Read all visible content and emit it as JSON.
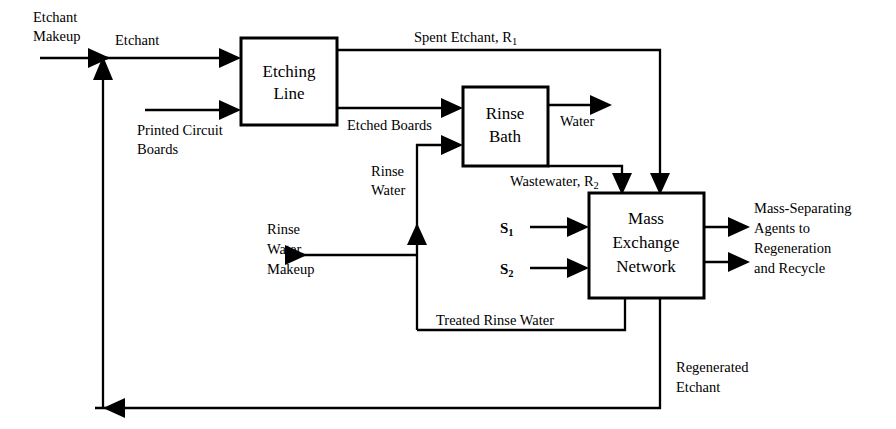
{
  "diagram": {
    "stroke_color": "#000000",
    "background_color": "#ffffff",
    "units": [
      {
        "id": "etching_line",
        "label_line1": "Etching",
        "label_line2": "Line"
      },
      {
        "id": "rinse_bath",
        "label_line1": "Rinse",
        "label_line2": "Bath"
      },
      {
        "id": "mass_exchange",
        "label_line1": "Mass",
        "label_line2": "Exchange",
        "label_line3": "Network"
      }
    ],
    "streams": {
      "etchant_makeup_l1": "Etchant",
      "etchant_makeup_l2": "Makeup",
      "etchant": "Etchant",
      "printed_circuit_boards_l1": "Printed Circuit",
      "printed_circuit_boards_l2": "Boards",
      "spent_etchant": "Spent Etchant, R",
      "spent_etchant_sub": "1",
      "etched_boards": "Etched Boards",
      "water": "Water",
      "wastewater": "Wastewater, R",
      "wastewater_sub": "2",
      "rinse_water_l1": "Rinse",
      "rinse_water_l2": "Water",
      "rinse_water_makeup_l1": "Rinse",
      "rinse_water_makeup_l2": "Water",
      "rinse_water_makeup_l3": "Makeup",
      "treated_rinse_water": "Treated Rinse Water",
      "regenerated_etchant_l1": "Regenerated",
      "regenerated_etchant_l2": "Etchant",
      "msa_s1": "S",
      "msa_s1_sub": "1",
      "msa_s2": "S",
      "msa_s2_sub": "2",
      "msa_out_l1": "Mass-Separating",
      "msa_out_l2": "Agents to",
      "msa_out_l3": "Regeneration",
      "msa_out_l4": "and Recycle"
    }
  }
}
